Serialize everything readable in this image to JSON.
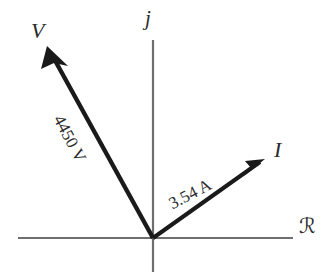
{
  "figure": {
    "type": "phasor-diagram",
    "background_color": "#ffffff",
    "axis_color": "#6e6e6e",
    "vector_color": "#1a1a1a",
    "text_color": "#2b2b2b",
    "axes": {
      "imaginary_label": "j",
      "real_label": "ℛ",
      "origin": {
        "x": 153,
        "y": 238
      },
      "horizontal": {
        "x1": 18,
        "y1": 238,
        "x2": 293,
        "y2": 238
      },
      "vertical": {
        "x1": 153,
        "y1": 40,
        "x2": 153,
        "y2": 272
      }
    },
    "vectors": [
      {
        "name": "voltage",
        "symbol": "V",
        "magnitude_label": "4450 V",
        "value": 4450,
        "unit": "V",
        "angle_deg": 118,
        "tip": {
          "x": 47,
          "y": 46
        },
        "tail": {
          "x": 153,
          "y": 238
        }
      },
      {
        "name": "current",
        "symbol": "I",
        "magnitude_label": "3.54 A",
        "value": 3.54,
        "unit": "A",
        "angle_deg": 28,
        "tip": {
          "x": 265,
          "y": 159
        },
        "tail": {
          "x": 153,
          "y": 238
        }
      }
    ]
  }
}
